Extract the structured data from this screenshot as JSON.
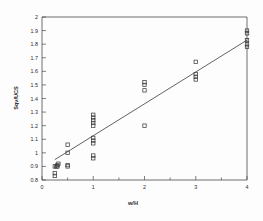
{
  "chart_data": {
    "type": "scatter",
    "title": "",
    "subtitle": "",
    "xlabel": "w/H",
    "ylabel": "Sqv/UCS",
    "xlim": [
      0,
      4
    ],
    "ylim": [
      0.8,
      2
    ],
    "grid": false,
    "legend": null,
    "marker_style": "open-square",
    "xticks": [
      0,
      1,
      2,
      3,
      4
    ],
    "xtick_labels": [
      "0",
      "1",
      "2",
      "3",
      "4"
    ],
    "xminor_ticks": [
      0.5,
      1.5,
      2.5,
      3.5
    ],
    "yticks": [
      0.8,
      0.9,
      1.0,
      1.1,
      1.2,
      1.3,
      1.4,
      1.5,
      1.6,
      1.7,
      1.8,
      1.9,
      2.0
    ],
    "ytick_labels": [
      "0.8",
      "0.9",
      "1",
      "1.1",
      "1.2",
      "1.3",
      "1.4",
      "1.5",
      "1.6",
      "1.7",
      "1.8",
      "1.9",
      "2"
    ],
    "series": [
      {
        "name": "data",
        "points": [
          [
            0.25,
            0.83
          ],
          [
            0.25,
            0.85
          ],
          [
            0.25,
            0.9
          ],
          [
            0.28,
            0.9
          ],
          [
            0.3,
            0.9
          ],
          [
            0.3,
            0.91
          ],
          [
            0.32,
            0.92
          ],
          [
            0.5,
            0.9
          ],
          [
            0.5,
            0.91
          ],
          [
            0.5,
            1.0
          ],
          [
            0.5,
            1.06
          ],
          [
            1.0,
            0.96
          ],
          [
            1.0,
            0.98
          ],
          [
            1.0,
            1.07
          ],
          [
            1.0,
            1.09
          ],
          [
            1.0,
            1.11
          ],
          [
            1.0,
            1.2
          ],
          [
            1.0,
            1.22
          ],
          [
            1.0,
            1.24
          ],
          [
            1.0,
            1.26
          ],
          [
            1.0,
            1.28
          ],
          [
            2.0,
            1.2
          ],
          [
            2.0,
            1.46
          ],
          [
            2.0,
            1.5
          ],
          [
            2.0,
            1.52
          ],
          [
            3.0,
            1.54
          ],
          [
            3.0,
            1.56
          ],
          [
            3.0,
            1.58
          ],
          [
            3.0,
            1.67
          ],
          [
            4.0,
            1.78
          ],
          [
            4.0,
            1.8
          ],
          [
            4.0,
            1.83
          ],
          [
            4.0,
            1.88
          ],
          [
            4.0,
            1.9
          ]
        ]
      }
    ],
    "trendline": {
      "type": "linear",
      "x_start": 0.25,
      "y_start": 0.95,
      "x_end": 4.0,
      "y_end": 1.83
    }
  }
}
